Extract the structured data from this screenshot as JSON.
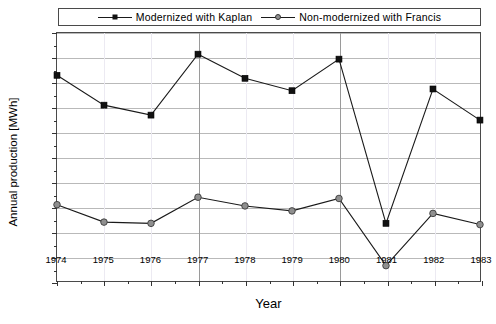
{
  "clipped_header_text": "",
  "legend": {
    "position": "top",
    "items": [
      {
        "label": "Modernized with Kaplan",
        "marker": "filled-square",
        "color": "#111111"
      },
      {
        "label": "Non-modernized with Francis",
        "marker": "open-circle",
        "color": "#8f8f8f"
      }
    ]
  },
  "chart_data": {
    "type": "line",
    "title": "",
    "xlabel": "Year",
    "ylabel": "Annual production [MWh]",
    "x": [
      1974,
      1975,
      1976,
      1977,
      1978,
      1979,
      1980,
      1981,
      1982,
      1983
    ],
    "xtick_labels": [
      "1974",
      "1975",
      "1976",
      "1977",
      "1978",
      "1979",
      "1980",
      "1981",
      "1982",
      "1983"
    ],
    "ytick_labels": [
      "0",
      "100",
      "200",
      "300",
      "400",
      "500",
      "600",
      "700",
      "800",
      "900",
      "1000"
    ],
    "ylim": [
      0,
      1000
    ],
    "xlim": [
      1974,
      1983
    ],
    "ytick_step": 100,
    "grid": true,
    "legend_position": "top",
    "series": [
      {
        "name": "Modernized with Kaplan",
        "marker": "filled-square",
        "color": "#111111",
        "values": [
          830,
          710,
          670,
          915,
          818,
          768,
          895,
          235,
          775,
          650
        ]
      },
      {
        "name": "Non-modernized with Francis",
        "marker": "open-circle",
        "color": "#8f8f8f",
        "values": [
          310,
          240,
          235,
          340,
          305,
          285,
          335,
          65,
          275,
          230
        ]
      }
    ]
  }
}
